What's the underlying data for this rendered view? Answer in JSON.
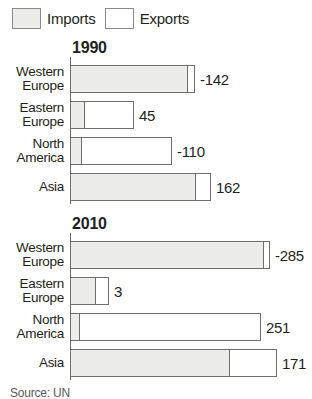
{
  "legend": {
    "items": [
      {
        "label": "Imports",
        "swatch": "imports-swatch",
        "color": "#ececea"
      },
      {
        "label": "Exports",
        "swatch": "exports-swatch",
        "color": "#ffffff"
      }
    ]
  },
  "source": {
    "text": "Source: UN"
  },
  "chart_data": {
    "type": "bar",
    "title": "",
    "xlabel": "",
    "ylabel": "",
    "orientation": "horizontal",
    "stacked": true,
    "grid": false,
    "legend_position": "top-left",
    "legend": [
      "Imports",
      "Exports"
    ],
    "categories": [
      "Western Europe",
      "Eastern Europe",
      "North America",
      "Asia"
    ],
    "panels": [
      {
        "title": "1990",
        "rows": [
          {
            "category": "Western Europe",
            "label": "-142",
            "value": -142,
            "imports": 118,
            "exports": 8
          },
          {
            "category": "Eastern Europe",
            "label": "45",
            "value": 45,
            "imports": 15,
            "exports": 50
          },
          {
            "category": "North America",
            "label": "-110",
            "value": -110,
            "imports": 12,
            "exports": 91
          },
          {
            "category": "Asia",
            "label": "162",
            "value": 162,
            "imports": 126,
            "exports": 16
          }
        ]
      },
      {
        "title": "2010",
        "rows": [
          {
            "category": "Western Europe",
            "label": "-285",
            "value": -285,
            "imports": 194,
            "exports": 7
          },
          {
            "category": "Eastern Europe",
            "label": "3",
            "value": 3,
            "imports": 26,
            "exports": 14
          },
          {
            "category": "North America",
            "label": "251",
            "value": 251,
            "imports": 10,
            "exports": 182
          },
          {
            "category": "Asia",
            "label": "171",
            "value": 171,
            "imports": 160,
            "exports": 48
          }
        ]
      }
    ]
  }
}
